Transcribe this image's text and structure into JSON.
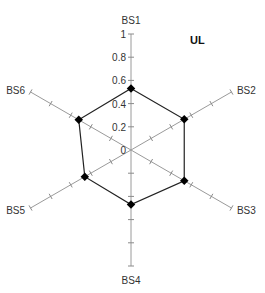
{
  "chart_data": {
    "type": "radar",
    "title": "UL",
    "categories": [
      "BS1",
      "BS2",
      "BS3",
      "BS4",
      "BS5",
      "BS6"
    ],
    "series": [
      {
        "name": "UL",
        "values": [
          0.53,
          0.53,
          0.53,
          0.47,
          0.46,
          0.52
        ]
      }
    ],
    "rlim": [
      0,
      1
    ],
    "radial_ticks": [
      "0",
      "0.2",
      "0.4",
      "0.6",
      "0.8",
      "1"
    ],
    "grid": false,
    "legend": "none"
  }
}
